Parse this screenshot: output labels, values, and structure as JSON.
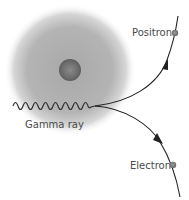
{
  "diagram": {
    "labels": {
      "gamma_ray": "Gamma ray",
      "positron": "Positron",
      "electron": "Electron"
    },
    "colors": {
      "cloud": "#9a9a9a",
      "nucleus": "#6e6e6e",
      "line": "#222222",
      "particle": "#7a7a7a",
      "text": "#4a4a4a"
    }
  }
}
